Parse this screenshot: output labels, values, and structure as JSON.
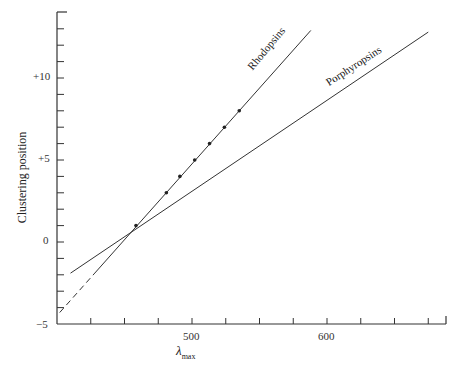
{
  "chart_data": {
    "type": "line",
    "title": "",
    "xlabel": "λmax",
    "ylabel": "Clustering position",
    "xlim": [
      400,
      687
    ],
    "ylim": [
      -5,
      14
    ],
    "x_ticks": [
      500,
      600
    ],
    "x_minor_tick_step": 25,
    "y_ticks": [
      "+10",
      "+5",
      "0",
      "−5"
    ],
    "y_minor_tick_step": 1,
    "grid": false,
    "legend": "inline labels on lines",
    "series": [
      {
        "name": "Rhodopsins",
        "points": [
          {
            "x": 458.5,
            "y": 1.0
          },
          {
            "x": 481,
            "y": 3.0
          },
          {
            "x": 491,
            "y": 4.0
          },
          {
            "x": 502,
            "y": 5.0
          },
          {
            "x": 513,
            "y": 6.0
          },
          {
            "x": 524,
            "y": 7.0
          },
          {
            "x": 535,
            "y": 8.0
          }
        ],
        "fit_line": {
          "x0": 402,
          "y0": -4.3,
          "x1": 588,
          "y1": 12.9
        },
        "dashed_below_x": 428
      },
      {
        "name": "Porphyropsins",
        "points": [],
        "fit_line": {
          "x0": 410,
          "y0": -1.9,
          "x1": 675,
          "y1": 12.8
        }
      }
    ]
  },
  "labels": {
    "y_axis": "Clustering position",
    "x_axis_main": "λ",
    "x_axis_sub": "max",
    "tick_500": "500",
    "tick_600": "600",
    "tick_p10": "+10",
    "tick_p5": "+5",
    "tick_0": "0",
    "tick_m5": "−5",
    "rhodopsins": "Rhodopsins",
    "porphyropsins": "Porphyropsins"
  }
}
